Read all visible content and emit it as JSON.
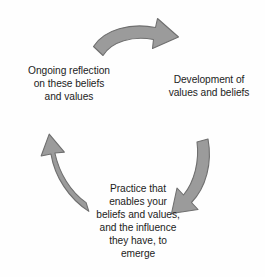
{
  "diagram": {
    "type": "cyclical-process",
    "background_color": "#fefefe",
    "arrow_fill": "#9b9b9b",
    "arrow_stroke": "#6f6f6f",
    "text_color": "#1c1c1c",
    "stages": [
      {
        "id": "development",
        "position": "right",
        "text": "Development of\nvalues and beliefs"
      },
      {
        "id": "practice",
        "position": "bottom",
        "text": "Practice that\nenables your\nbeliefs and values,\nand the influence\nthey have, to\nemerge"
      },
      {
        "id": "reflection",
        "position": "left",
        "text": "Ongoing reflection\non these beliefs\nand values"
      }
    ],
    "arrows": [
      {
        "id": "arrow-top",
        "from": "reflection",
        "to": "development",
        "direction": "clockwise",
        "points": "right"
      },
      {
        "id": "arrow-right",
        "from": "development",
        "to": "practice",
        "direction": "clockwise",
        "points": "down-left"
      },
      {
        "id": "arrow-left",
        "from": "practice",
        "to": "reflection",
        "direction": "clockwise",
        "points": "up-left"
      }
    ]
  }
}
